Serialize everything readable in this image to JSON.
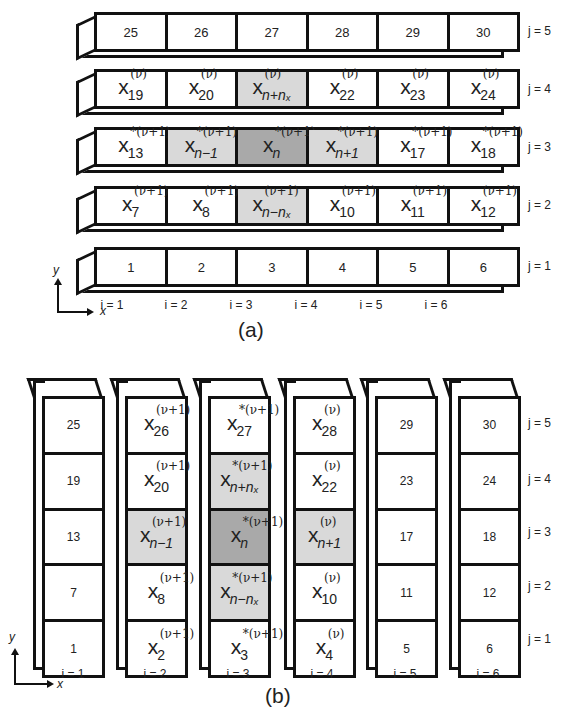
{
  "part_a": {
    "caption": "(a)",
    "rows": [
      {
        "j_label": "j = 5",
        "cells": [
          {
            "type": "num",
            "text": "25"
          },
          {
            "type": "num",
            "text": "26"
          },
          {
            "type": "num",
            "text": "27"
          },
          {
            "type": "num",
            "text": "28"
          },
          {
            "type": "num",
            "text": "29"
          },
          {
            "type": "num",
            "text": "30"
          }
        ]
      },
      {
        "j_label": "j = 4",
        "cells": [
          {
            "type": "math",
            "base": "x",
            "sub": "19",
            "sup": "(ν)"
          },
          {
            "type": "math",
            "base": "x",
            "sub": "20",
            "sup": "(ν)"
          },
          {
            "type": "math",
            "base": "x",
            "sub": "n+nx",
            "sup": "(ν)",
            "shade": "light"
          },
          {
            "type": "math",
            "base": "x",
            "sub": "22",
            "sup": "(ν)"
          },
          {
            "type": "math",
            "base": "x",
            "sub": "23",
            "sup": "(ν)"
          },
          {
            "type": "math",
            "base": "x",
            "sub": "24",
            "sup": "(ν)"
          }
        ]
      },
      {
        "j_label": "j = 3",
        "cells": [
          {
            "type": "math",
            "base": "x",
            "sub": "13",
            "sup": "*(ν+1)"
          },
          {
            "type": "math",
            "base": "x",
            "sub": "n−1",
            "sup": "*(ν+1)",
            "shade": "light"
          },
          {
            "type": "math",
            "base": "x",
            "sub": "n",
            "sup": "*(ν+1)",
            "shade": "dark"
          },
          {
            "type": "math",
            "base": "x",
            "sub": "n+1",
            "sup": "*(ν+1)",
            "shade": "light"
          },
          {
            "type": "math",
            "base": "x",
            "sub": "17",
            "sup": "*(ν+1)"
          },
          {
            "type": "math",
            "base": "x",
            "sub": "18",
            "sup": "*(ν+1)"
          }
        ]
      },
      {
        "j_label": "j = 2",
        "cells": [
          {
            "type": "math",
            "base": "x",
            "sub": "7",
            "sup": "(ν+1)"
          },
          {
            "type": "math",
            "base": "x",
            "sub": "8",
            "sup": "(ν+1)"
          },
          {
            "type": "math",
            "base": "x",
            "sub": "n−nx",
            "sup": "(ν+1)",
            "shade": "light"
          },
          {
            "type": "math",
            "base": "x",
            "sub": "10",
            "sup": "(ν+1)"
          },
          {
            "type": "math",
            "base": "x",
            "sub": "11",
            "sup": "(ν+1)"
          },
          {
            "type": "math",
            "base": "x",
            "sub": "12",
            "sup": "(ν+1)"
          }
        ]
      },
      {
        "j_label": "j = 1",
        "cells": [
          {
            "type": "num",
            "text": "1"
          },
          {
            "type": "num",
            "text": "2"
          },
          {
            "type": "num",
            "text": "3"
          },
          {
            "type": "num",
            "text": "4"
          },
          {
            "type": "num",
            "text": "5"
          },
          {
            "type": "num",
            "text": "6"
          }
        ]
      }
    ],
    "i_labels": [
      "i = 1",
      "i = 2",
      "i = 3",
      "i = 4",
      "i = 5",
      "i = 6"
    ],
    "axes": {
      "x": "x",
      "y": "y"
    }
  },
  "part_b": {
    "caption": "(b)",
    "j_labels": [
      "j = 5",
      "j = 4",
      "j = 3",
      "j = 2",
      "j = 1"
    ],
    "i_labels": [
      "i = 1",
      "i = 2",
      "i = 3",
      "i = 4",
      "i = 5",
      "i = 6"
    ],
    "axes": {
      "x": "x",
      "y": "y"
    },
    "columns": [
      {
        "cells": [
          {
            "type": "num",
            "text": "25"
          },
          {
            "type": "num",
            "text": "19"
          },
          {
            "type": "num",
            "text": "13"
          },
          {
            "type": "num",
            "text": "7"
          },
          {
            "type": "num",
            "text": "1"
          }
        ]
      },
      {
        "cells": [
          {
            "type": "math",
            "base": "x",
            "sub": "26",
            "sup": "(ν+1)"
          },
          {
            "type": "math",
            "base": "x",
            "sub": "20",
            "sup": "(ν+1)"
          },
          {
            "type": "math",
            "base": "x",
            "sub": "n−1",
            "sup": "(ν+1)",
            "shade": "light"
          },
          {
            "type": "math",
            "base": "x",
            "sub": "8",
            "sup": "(ν+1)"
          },
          {
            "type": "math",
            "base": "x",
            "sub": "2",
            "sup": "(ν+1)"
          }
        ]
      },
      {
        "cells": [
          {
            "type": "math",
            "base": "x",
            "sub": "27",
            "sup": "*(ν+1)"
          },
          {
            "type": "math",
            "base": "x",
            "sub": "n+nx",
            "sup": "*(ν+1)",
            "shade": "light"
          },
          {
            "type": "math",
            "base": "x",
            "sub": "n",
            "sup": "*(ν+1)",
            "shade": "dark"
          },
          {
            "type": "math",
            "base": "x",
            "sub": "n−nx",
            "sup": "*(ν+1)",
            "shade": "light"
          },
          {
            "type": "math",
            "base": "x",
            "sub": "3",
            "sup": "*(ν+1)"
          }
        ]
      },
      {
        "cells": [
          {
            "type": "math",
            "base": "x",
            "sub": "28",
            "sup": "(ν)"
          },
          {
            "type": "math",
            "base": "x",
            "sub": "22",
            "sup": "(ν)"
          },
          {
            "type": "math",
            "base": "x",
            "sub": "n+1",
            "sup": "(ν)",
            "shade": "light"
          },
          {
            "type": "math",
            "base": "x",
            "sub": "10",
            "sup": "(ν)"
          },
          {
            "type": "math",
            "base": "x",
            "sub": "4",
            "sup": "(ν)"
          }
        ]
      },
      {
        "cells": [
          {
            "type": "num",
            "text": "29"
          },
          {
            "type": "num",
            "text": "23"
          },
          {
            "type": "num",
            "text": "17"
          },
          {
            "type": "num",
            "text": "11"
          },
          {
            "type": "num",
            "text": "5"
          }
        ]
      },
      {
        "cells": [
          {
            "type": "num",
            "text": "30"
          },
          {
            "type": "num",
            "text": "24"
          },
          {
            "type": "num",
            "text": "18"
          },
          {
            "type": "num",
            "text": "12"
          },
          {
            "type": "num",
            "text": "6"
          }
        ]
      }
    ]
  },
  "colors": {
    "line": "#111111",
    "shade_light": "#d9d9d9",
    "shade_dark": "#a9a9a9",
    "background": "#ffffff"
  }
}
